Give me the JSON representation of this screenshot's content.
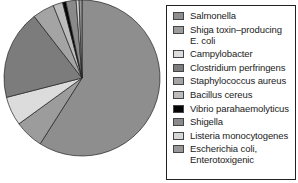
{
  "chart_data": {
    "type": "pie",
    "title": "",
    "start_angle_deg": 0,
    "direction": "clockwise",
    "legend_position": "right",
    "categories": [
      "Salmonella",
      "Shiga toxin–producing E. coli",
      "Campylobacter",
      "Clostridium perfringens",
      "Staphylococcus aureus",
      "Bacillus cereus",
      "Vibrio parahaemolyticus",
      "Shigella",
      "Listeria monocytogenes",
      "Escherichia coli, Enterotoxigenic"
    ],
    "values": [
      59.0,
      6.0,
      6.0,
      18.5,
      4.5,
      2.0,
      0.7,
      2.1,
      0.6,
      0.6
    ],
    "colors": [
      "#8e8e8e",
      "#9c9c9c",
      "#dcdcdc",
      "#7c7c7c",
      "#a4a4a4",
      "#bcbcbc",
      "#050505",
      "#8a8a8a",
      "#d6d6d6",
      "#979797"
    ]
  },
  "legend": {
    "items": [
      {
        "label": "Salmonella",
        "color": "#8e8e8e"
      },
      {
        "label": "Shiga toxin–producing",
        "label2": "E. coli",
        "color": "#9c9c9c"
      },
      {
        "label": "Campylobacter",
        "color": "#dcdcdc"
      },
      {
        "label": "Clostridium perfringens",
        "color": "#7c7c7c"
      },
      {
        "label": "Staphylococcus aureus",
        "color": "#a4a4a4"
      },
      {
        "label": "Bacillus cereus",
        "color": "#bcbcbc"
      },
      {
        "label": "Vibrio parahaemolyticus",
        "color": "#050505"
      },
      {
        "label": "Shigella",
        "color": "#8a8a8a"
      },
      {
        "label": "Listeria monocytogenes",
        "color": "#d6d6d6"
      },
      {
        "label": "Escherichia coli,",
        "label2": "Enterotoxigenic",
        "color": "#979797"
      }
    ]
  }
}
